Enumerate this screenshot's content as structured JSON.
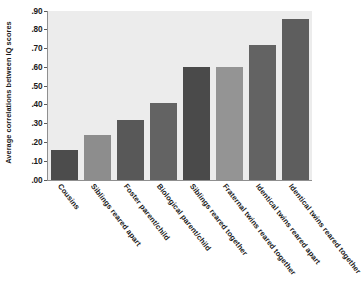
{
  "chart_data": {
    "type": "bar",
    "title": "",
    "xlabel": "",
    "ylabel": "Average correlations between IQ scores",
    "ylim": [
      0.0,
      0.9
    ],
    "grid": false,
    "legend": "none",
    "ytick_labels": [
      ".90",
      ".80",
      ".70",
      ".60",
      ".50",
      ".40",
      ".30",
      ".20",
      ".10",
      ".00"
    ],
    "ytick_values": [
      0.9,
      0.8,
      0.7,
      0.6,
      0.5,
      0.4,
      0.3,
      0.2,
      0.1,
      0.0
    ],
    "categories": [
      "Cousins",
      "Siblings reared apart",
      "Foster parent/child",
      "Biological parent/child",
      "Siblings reared together",
      "Fraternal twins reared together",
      "Identical twins reared apart",
      "Identical twins reared together"
    ],
    "values": [
      0.16,
      0.24,
      0.32,
      0.41,
      0.6,
      0.6,
      0.72,
      0.86
    ],
    "bar_colors": [
      "#4c4c4c",
      "#8d8d8d",
      "#585858",
      "#636363",
      "#4a4a4a",
      "#949494",
      "#636363",
      "#5e5e5e"
    ],
    "plot_background": "#ececec",
    "axis_color": "#8f8f8f",
    "text_color": "#1a1a1a"
  }
}
